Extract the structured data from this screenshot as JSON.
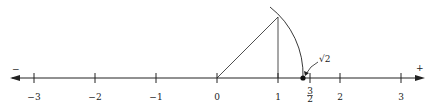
{
  "diagram": {
    "type": "number_line_sqrt2_construction",
    "sign_left": "−",
    "sign_right": "+",
    "ticks": [
      {
        "label": "−3",
        "value": -3
      },
      {
        "label": "−2",
        "value": -2
      },
      {
        "label": "−1",
        "value": -1
      },
      {
        "label": "0",
        "value": 0
      },
      {
        "label": "1",
        "value": 1
      },
      {
        "label": "2",
        "value": 2
      },
      {
        "label": "3",
        "value": 3
      }
    ],
    "fraction_tick": {
      "numerator": "3",
      "denominator": "2",
      "value": 1.5
    },
    "point_label": "√2",
    "point_value": 1.414,
    "colors": {
      "stroke": "#222222",
      "background": "#ffffff"
    }
  }
}
